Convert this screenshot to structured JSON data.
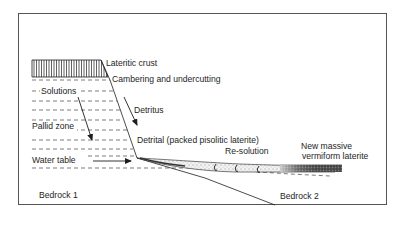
{
  "colors": {
    "ink": "#1e1e1e",
    "frame": "#555555",
    "dash": "#444444",
    "background": "#ffffff"
  },
  "labels": {
    "lateritic_crust": "Lateritic crust",
    "cambering": "Cambering and undercutting",
    "solutions": "Solutions",
    "detritus": "Detritus",
    "pallid_zone": "Pallid zone",
    "detrital": "Detrital (packed pisolitic laterite)",
    "re_solution": "Re-solution",
    "new_massive_line1": "New massive",
    "new_massive_line2": "vermiform laterite",
    "water_table": "Water table",
    "bedrock1": "Bedrock 1",
    "bedrock2": "Bedrock 2"
  },
  "arrows": [
    {
      "name": "solutions-arrow",
      "meaning": "Solutions moving downward through pallid zone"
    },
    {
      "name": "detritus-arrow",
      "meaning": "Detritus moving down slope"
    },
    {
      "name": "water-table-arrow",
      "meaning": "Water table lateral flow"
    }
  ]
}
